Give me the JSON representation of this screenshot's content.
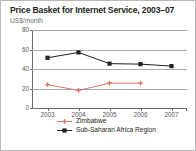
{
  "chart_data": {
    "type": "line",
    "title": "Price Basket for Internet Service, 2003–07",
    "subtitle": "US$/month",
    "ylabel": "US$/month",
    "xlabel": "",
    "categories": [
      "2003",
      "2004",
      "2005",
      "2006",
      "2007"
    ],
    "x": [
      2003,
      2004,
      2005,
      2006,
      2007
    ],
    "ylim": [
      0,
      80
    ],
    "yticks": [
      0,
      20,
      40,
      60,
      80
    ],
    "ytick_labels": [
      "0",
      "20",
      "40",
      "60",
      "80"
    ],
    "xtick_labels": [
      "2003",
      "2004",
      "2005",
      "2006",
      "2007"
    ],
    "grid": true,
    "grid_axis": "y",
    "legend_position": "bottom",
    "series": [
      {
        "name": "Zimbabwe",
        "color": "#d9776a",
        "marker": "cross",
        "values": [
          24,
          18,
          25.5,
          25.5,
          null
        ]
      },
      {
        "name": "Sub-Saharan Africa Region",
        "color": "#231f20",
        "marker": "square",
        "values": [
          51.5,
          57,
          45.5,
          45,
          43
        ]
      }
    ]
  },
  "legend": {
    "items": [
      {
        "label": "Zimbabwe",
        "color": "#d9776a",
        "marker": "cross"
      },
      {
        "label": "Sub-Saharan Africa Region",
        "color": "#231f20",
        "marker": "square"
      }
    ]
  },
  "colors": {
    "zimbabwe": "#d9776a",
    "ssa_region": "#231f20",
    "grid": "#a7a9ac",
    "axis": "#6d6e71",
    "tick_text": "#58595b",
    "title_text": "#231f20",
    "subtitle_text": "#6d6e71",
    "border": "#b8b8b8",
    "background": "#ffffff"
  }
}
